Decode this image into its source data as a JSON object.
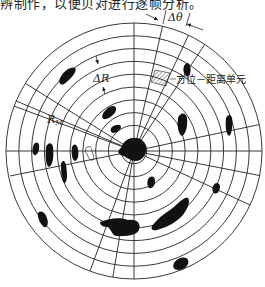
{
  "caption_fragment": "辨制作，以便贝对进行逐帧分析。",
  "diagram": {
    "type": "polar-radar-grid",
    "center": [
      134,
      151
    ],
    "outer_radius": 128,
    "ring_count": 10,
    "labels": {
      "delta_theta": "Δθ",
      "delta_r": "ΔR",
      "r_max": "R",
      "r_max_sub": "M",
      "cell_label": "方位－距离单元"
    },
    "colors": {
      "line": "#222222",
      "echo": "#111111",
      "background": "#ffffff"
    }
  }
}
